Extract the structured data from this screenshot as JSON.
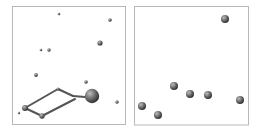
{
  "canvas": {
    "width": 261,
    "height": 132,
    "background": "#ffffff"
  },
  "colors": {
    "border": "#b8b8b8",
    "line": "#555555",
    "sphere_light": "#bdbdbd",
    "sphere_mid": "#7a7a7a",
    "sphere_dark": "#2e2e2e"
  },
  "panels": [
    {
      "id": "left",
      "frame": {
        "x": 12.5,
        "y": 6.5,
        "w": 113,
        "h": 118
      },
      "nodes": [
        {
          "x": 59,
          "y": 14,
          "r": 1.3
        },
        {
          "x": 110,
          "y": 20,
          "r": 1.8
        },
        {
          "x": 100,
          "y": 43,
          "r": 2.6
        },
        {
          "x": 41,
          "y": 50,
          "r": 1.3
        },
        {
          "x": 49,
          "y": 50,
          "r": 1.7
        },
        {
          "x": 36,
          "y": 75,
          "r": 1.9
        },
        {
          "x": 86,
          "y": 82,
          "r": 1.8
        },
        {
          "x": 58,
          "y": 89,
          "r": 1.6
        },
        {
          "x": 92,
          "y": 96,
          "r": 7.2
        },
        {
          "x": 117,
          "y": 102,
          "r": 1.7
        },
        {
          "x": 25,
          "y": 108,
          "r": 3.0
        },
        {
          "x": 19,
          "y": 113,
          "r": 1.2
        },
        {
          "x": 42,
          "y": 116,
          "r": 2.7
        }
      ],
      "edges": [
        {
          "x1": 25,
          "y1": 108,
          "x2": 58,
          "y2": 89
        },
        {
          "x1": 58,
          "y1": 89,
          "x2": 73,
          "y2": 96
        },
        {
          "x1": 73,
          "y1": 96,
          "x2": 85,
          "y2": 97
        },
        {
          "x1": 42,
          "y1": 116,
          "x2": 75,
          "y2": 99
        },
        {
          "x1": 25,
          "y1": 108,
          "x2": 42,
          "y2": 116
        }
      ]
    },
    {
      "id": "right",
      "frame": {
        "x": 134.5,
        "y": 6.5,
        "w": 114,
        "h": 118.5
      },
      "nodes": [
        {
          "x": 225,
          "y": 19,
          "r": 4.0
        },
        {
          "x": 174,
          "y": 86,
          "r": 4.0
        },
        {
          "x": 190,
          "y": 94,
          "r": 4.0
        },
        {
          "x": 208,
          "y": 95,
          "r": 4.0
        },
        {
          "x": 240,
          "y": 100,
          "r": 4.0
        },
        {
          "x": 142,
          "y": 106,
          "r": 4.0
        },
        {
          "x": 158,
          "y": 115,
          "r": 4.0
        }
      ],
      "edges": []
    }
  ]
}
